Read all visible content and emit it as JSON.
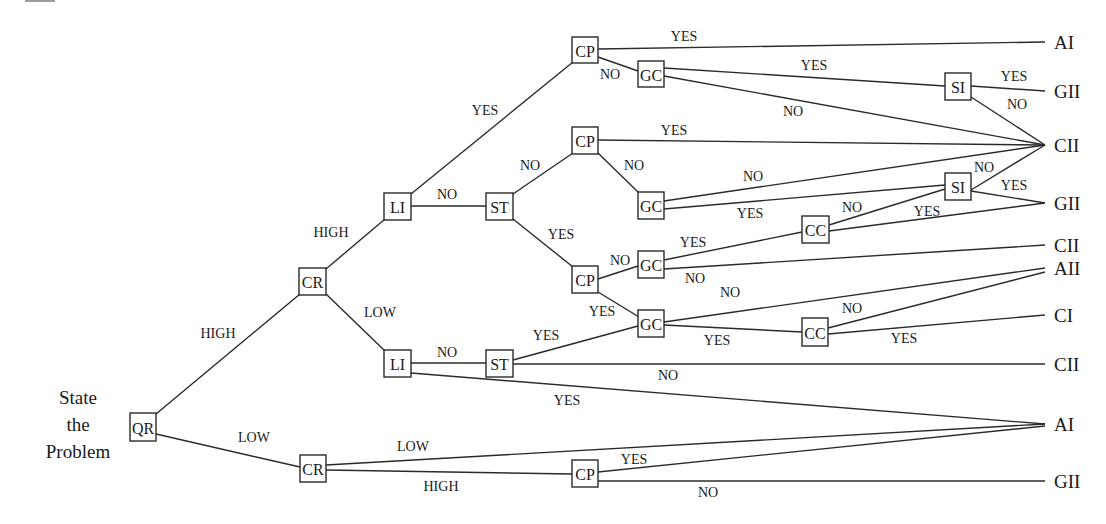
{
  "start": {
    "lines": [
      "State",
      "the",
      "Problem"
    ],
    "x": 78,
    "y": 404
  },
  "nodes": [
    {
      "id": "qr",
      "label": "QR",
      "x": 130,
      "y": 413,
      "w": 26,
      "h": 28
    },
    {
      "id": "cr_hi",
      "label": "CR",
      "x": 299,
      "y": 268,
      "w": 27,
      "h": 27
    },
    {
      "id": "cr_lo",
      "label": "CR",
      "x": 300,
      "y": 455,
      "w": 26,
      "h": 27
    },
    {
      "id": "li_hi",
      "label": "LI",
      "x": 384,
      "y": 193,
      "w": 27,
      "h": 27
    },
    {
      "id": "li_lo",
      "label": "LI",
      "x": 384,
      "y": 350,
      "w": 27,
      "h": 27
    },
    {
      "id": "st_hi",
      "label": "ST",
      "x": 486,
      "y": 193,
      "w": 27,
      "h": 27
    },
    {
      "id": "st_lo",
      "label": "ST",
      "x": 486,
      "y": 350,
      "w": 27,
      "h": 27
    },
    {
      "id": "cp1",
      "label": "CP",
      "x": 572,
      "y": 37,
      "w": 26,
      "h": 26
    },
    {
      "id": "cp2",
      "label": "CP",
      "x": 572,
      "y": 127,
      "w": 26,
      "h": 27
    },
    {
      "id": "cp3",
      "label": "CP",
      "x": 572,
      "y": 266,
      "w": 26,
      "h": 27
    },
    {
      "id": "cp4",
      "label": "CP",
      "x": 572,
      "y": 460,
      "w": 26,
      "h": 27
    },
    {
      "id": "gc1",
      "label": "GC",
      "x": 638,
      "y": 61,
      "w": 26,
      "h": 26
    },
    {
      "id": "gc2",
      "label": "GC",
      "x": 638,
      "y": 192,
      "w": 26,
      "h": 27
    },
    {
      "id": "gc3",
      "label": "GC",
      "x": 638,
      "y": 251,
      "w": 26,
      "h": 27
    },
    {
      "id": "gc4",
      "label": "GC",
      "x": 638,
      "y": 310,
      "w": 26,
      "h": 27
    },
    {
      "id": "cc1",
      "label": "CC",
      "x": 802,
      "y": 216,
      "w": 27,
      "h": 27
    },
    {
      "id": "cc2",
      "label": "CC",
      "x": 802,
      "y": 318,
      "w": 26,
      "h": 28
    },
    {
      "id": "si1",
      "label": "SI",
      "x": 945,
      "y": 73,
      "w": 26,
      "h": 27
    },
    {
      "id": "si2",
      "label": "SI",
      "x": 945,
      "y": 173,
      "w": 26,
      "h": 27
    }
  ],
  "outcomes": [
    {
      "id": "o_ai1",
      "label": "AI",
      "x": 1045,
      "y": 42
    },
    {
      "id": "o_gii1",
      "label": "GII",
      "x": 1045,
      "y": 91
    },
    {
      "id": "o_cii1",
      "label": "CII",
      "x": 1045,
      "y": 145
    },
    {
      "id": "o_gii2",
      "label": "GII",
      "x": 1045,
      "y": 203
    },
    {
      "id": "o_cii2",
      "label": "CII",
      "x": 1045,
      "y": 245
    },
    {
      "id": "o_aii",
      "label": "AII",
      "x": 1045,
      "y": 268
    },
    {
      "id": "o_ci",
      "label": "CI",
      "x": 1045,
      "y": 315
    },
    {
      "id": "o_cii3",
      "label": "CII",
      "x": 1045,
      "y": 364
    },
    {
      "id": "o_ai2",
      "label": "AI",
      "x": 1045,
      "y": 424
    },
    {
      "id": "o_gii3",
      "label": "GII",
      "x": 1045,
      "y": 481
    }
  ],
  "edges": [
    {
      "x1": 156,
      "y1": 414,
      "x2": 300,
      "y2": 294,
      "label": "HIGH",
      "lx": 218,
      "ly": 333
    },
    {
      "x1": 156,
      "y1": 434,
      "x2": 300,
      "y2": 467,
      "label": "LOW",
      "lx": 254,
      "ly": 437
    },
    {
      "x1": 326,
      "y1": 269,
      "x2": 385,
      "y2": 219,
      "label": "HIGH",
      "lx": 331,
      "ly": 232
    },
    {
      "x1": 326,
      "y1": 294,
      "x2": 385,
      "y2": 351,
      "label": "LOW",
      "lx": 380,
      "ly": 312
    },
    {
      "x1": 411,
      "y1": 206,
      "x2": 486,
      "y2": 206,
      "label": "NO",
      "lx": 447,
      "ly": 194
    },
    {
      "x1": 411,
      "y1": 194,
      "x2": 573,
      "y2": 62,
      "label": "YES",
      "lx": 485,
      "ly": 110
    },
    {
      "x1": 513,
      "y1": 194,
      "x2": 573,
      "y2": 153,
      "label": "NO",
      "lx": 530,
      "ly": 165
    },
    {
      "x1": 513,
      "y1": 219,
      "x2": 573,
      "y2": 267,
      "label": "YES",
      "lx": 561,
      "ly": 234
    },
    {
      "x1": 411,
      "y1": 363,
      "x2": 486,
      "y2": 363,
      "label": "NO",
      "lx": 447,
      "ly": 352
    },
    {
      "x1": 411,
      "y1": 373,
      "x2": 1045,
      "y2": 424,
      "label": "YES",
      "lx": 567,
      "ly": 400
    },
    {
      "x1": 598,
      "y1": 49,
      "x2": 1045,
      "y2": 42,
      "label": "YES",
      "lx": 684,
      "ly": 36
    },
    {
      "x1": 598,
      "y1": 57,
      "x2": 638,
      "y2": 71,
      "label": "NO",
      "lx": 610,
      "ly": 74
    },
    {
      "x1": 664,
      "y1": 68,
      "x2": 945,
      "y2": 86,
      "label": "YES",
      "lx": 814,
      "ly": 65
    },
    {
      "x1": 664,
      "y1": 76,
      "x2": 1045,
      "y2": 145,
      "label": "NO",
      "lx": 793,
      "ly": 111
    },
    {
      "x1": 971,
      "y1": 86,
      "x2": 1045,
      "y2": 91,
      "label": "YES",
      "lx": 1014,
      "ly": 76
    },
    {
      "x1": 971,
      "y1": 97,
      "x2": 1045,
      "y2": 145,
      "label": "NO",
      "lx": 1017,
      "ly": 104
    },
    {
      "x1": 598,
      "y1": 140,
      "x2": 1045,
      "y2": 145,
      "label": "YES",
      "lx": 674,
      "ly": 130
    },
    {
      "x1": 598,
      "y1": 153,
      "x2": 639,
      "y2": 193,
      "label": "NO",
      "lx": 634,
      "ly": 165
    },
    {
      "x1": 664,
      "y1": 201,
      "x2": 1045,
      "y2": 145,
      "label": "NO",
      "lx": 753,
      "ly": 176
    },
    {
      "x1": 664,
      "y1": 209,
      "x2": 945,
      "y2": 185,
      "label": "YES",
      "lx": 750,
      "ly": 213
    },
    {
      "x1": 971,
      "y1": 190,
      "x2": 1045,
      "y2": 145,
      "label": "NO",
      "lx": 984,
      "ly": 167
    },
    {
      "x1": 971,
      "y1": 191,
      "x2": 1045,
      "y2": 203,
      "label": "YES",
      "lx": 1014,
      "ly": 185
    },
    {
      "x1": 598,
      "y1": 279,
      "x2": 638,
      "y2": 266,
      "label": "NO",
      "lx": 620,
      "ly": 260
    },
    {
      "x1": 598,
      "y1": 292,
      "x2": 639,
      "y2": 317,
      "label": "YES",
      "lx": 602,
      "ly": 311
    },
    {
      "x1": 664,
      "y1": 260,
      "x2": 802,
      "y2": 232,
      "label": "YES",
      "lx": 693,
      "ly": 242
    },
    {
      "x1": 664,
      "y1": 269,
      "x2": 1045,
      "y2": 245,
      "label": "NO",
      "lx": 695,
      "ly": 278
    },
    {
      "x1": 829,
      "y1": 225,
      "x2": 945,
      "y2": 189,
      "label": "NO",
      "lx": 852,
      "ly": 207
    },
    {
      "x1": 829,
      "y1": 231,
      "x2": 1045,
      "y2": 203,
      "label": "YES",
      "lx": 927,
      "ly": 211
    },
    {
      "x1": 513,
      "y1": 360,
      "x2": 638,
      "y2": 326,
      "label": "YES",
      "lx": 546,
      "ly": 335
    },
    {
      "x1": 513,
      "y1": 364,
      "x2": 1045,
      "y2": 364,
      "label": "NO",
      "lx": 668,
      "ly": 375
    },
    {
      "x1": 664,
      "y1": 322,
      "x2": 1045,
      "y2": 268,
      "label": "NO",
      "lx": 730,
      "ly": 292
    },
    {
      "x1": 664,
      "y1": 325,
      "x2": 802,
      "y2": 332,
      "label": "YES",
      "lx": 717,
      "ly": 340
    },
    {
      "x1": 828,
      "y1": 328,
      "x2": 1045,
      "y2": 272,
      "label": "NO",
      "lx": 852,
      "ly": 308
    },
    {
      "x1": 828,
      "y1": 334,
      "x2": 1045,
      "y2": 315,
      "label": "YES",
      "lx": 904,
      "ly": 338
    },
    {
      "x1": 326,
      "y1": 465,
      "x2": 1045,
      "y2": 424,
      "label": "LOW",
      "lx": 413,
      "ly": 446
    },
    {
      "x1": 326,
      "y1": 470,
      "x2": 572,
      "y2": 474,
      "label": "HIGH",
      "lx": 441,
      "ly": 486
    },
    {
      "x1": 598,
      "y1": 472,
      "x2": 1045,
      "y2": 426,
      "label": "YES",
      "lx": 634,
      "ly": 459
    },
    {
      "x1": 598,
      "y1": 481,
      "x2": 1045,
      "y2": 481,
      "label": "NO",
      "lx": 708,
      "ly": 492
    }
  ]
}
